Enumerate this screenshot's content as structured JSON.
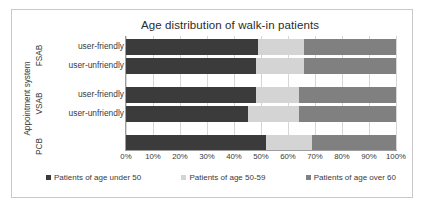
{
  "chart_data": {
    "type": "bar",
    "orientation": "horizontal",
    "stacked": true,
    "normalized": true,
    "title": "Age distribution of walk-in patients",
    "xlabel": "",
    "ylabel": "Appointment system",
    "xlim": [
      0,
      100
    ],
    "grid": true,
    "legend_position": "bottom",
    "xticks": [
      "0%",
      "10%",
      "20%",
      "30%",
      "40%",
      "50%",
      "60%",
      "70%",
      "80%",
      "90%",
      "100%"
    ],
    "xtick_values": [
      0,
      10,
      20,
      30,
      40,
      50,
      60,
      70,
      80,
      90,
      100
    ],
    "groups": [
      {
        "name": "FSAB",
        "categories": [
          "user-friendly",
          "user-unfriendly"
        ]
      },
      {
        "name": "VSAB",
        "categories": [
          "user-friendly",
          "user-unfriendly"
        ]
      },
      {
        "name": "PCB",
        "categories": [
          ""
        ]
      }
    ],
    "categories": [
      "FSAB / user-friendly",
      "FSAB / user-unfriendly",
      "VSAB / user-friendly",
      "VSAB / user-unfriendly",
      "PCB"
    ],
    "series": [
      {
        "name": "Patients of age under 50",
        "color": "#3b3b3b",
        "values": [
          49,
          48,
          48,
          45,
          52
        ]
      },
      {
        "name": "Patients of age 50-59",
        "color": "#d4d4d4",
        "values": [
          17,
          18,
          16,
          19,
          17
        ]
      },
      {
        "name": "Patients of age over 60",
        "color": "#808080",
        "values": [
          34,
          34,
          36,
          36,
          31
        ]
      }
    ],
    "bars": [
      {
        "group": "FSAB",
        "label": "user-friendly",
        "under50": 49,
        "age50to59": 17,
        "over60": 34
      },
      {
        "group": "FSAB",
        "label": "user-unfriendly",
        "under50": 48,
        "age50to59": 18,
        "over60": 34
      },
      {
        "group": "VSAB",
        "label": "user-friendly",
        "under50": 48,
        "age50to59": 16,
        "over60": 36
      },
      {
        "group": "VSAB",
        "label": "user-unfriendly",
        "under50": 45,
        "age50to59": 19,
        "over60": 36
      },
      {
        "group": "PCB",
        "label": "",
        "under50": 52,
        "age50to59": 17,
        "over60": 31
      }
    ],
    "legend": [
      "Patients of age under 50",
      "Patients of age 50-59",
      "Patients of age over 60"
    ]
  },
  "colors": {
    "under50": "#3b3b3b",
    "age50to59": "#d4d4d4",
    "over60": "#808080",
    "grid": "#d6d6d6",
    "frame": "#c9c9c9",
    "text": "#3a3a3a"
  }
}
